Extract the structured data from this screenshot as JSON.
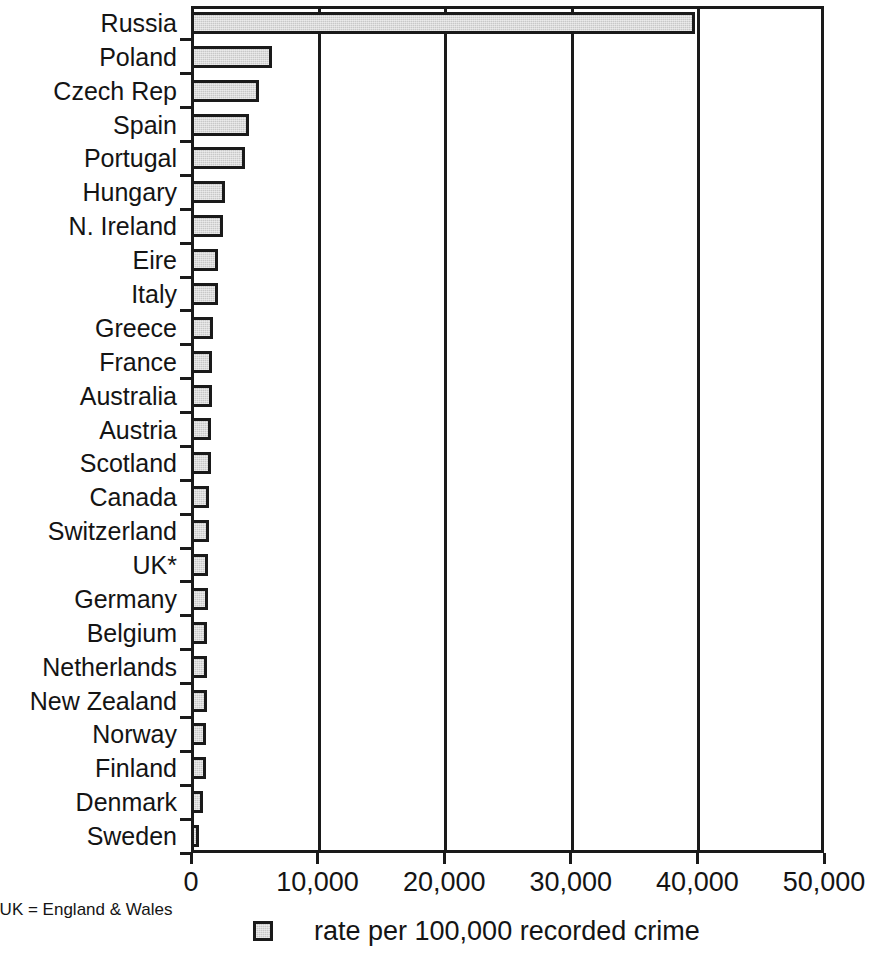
{
  "chart_data": {
    "type": "bar",
    "orientation": "horizontal",
    "title": "",
    "xlabel": "",
    "ylabel": "",
    "xlim": [
      0,
      50000
    ],
    "xticks": [
      0,
      10000,
      20000,
      30000,
      40000,
      50000
    ],
    "xtick_labels": [
      "0",
      "10,000",
      "20,000",
      "30,000",
      "40,000",
      "50,000"
    ],
    "grid": "vertical",
    "legend": {
      "position": "bottom",
      "entries": [
        {
          "label": "rate per 100,000 recorded crime",
          "color": "#c8c8c8"
        }
      ]
    },
    "categories": [
      "Russia",
      "Poland",
      "Czech Rep",
      "Spain",
      "Portugal",
      "Hungary",
      "N. Ireland",
      "Eire",
      "Italy",
      "Greece",
      "France",
      "Australia",
      "Austria",
      "Scotland",
      "Canada",
      "Switzerland",
      "UK*",
      "Germany",
      "Belgium",
      "Netherlands",
      "New Zealand",
      "Norway",
      "Finland",
      "Denmark",
      "Sweden"
    ],
    "values": [
      39800,
      6400,
      5400,
      4600,
      4300,
      2700,
      2500,
      2150,
      2150,
      1700,
      1650,
      1650,
      1600,
      1550,
      1400,
      1400,
      1350,
      1350,
      1300,
      1300,
      1300,
      1150,
      1150,
      950,
      650
    ]
  },
  "footnote": "*UK = England & Wales",
  "colors": {
    "bar_fill": "#c8c8c8",
    "bar_stroke": "#1a1a1a",
    "axis": "#1a1a1a",
    "text": "#141414",
    "background": "#ffffff"
  }
}
